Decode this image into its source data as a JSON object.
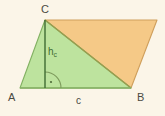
{
  "figure": {
    "kind": "geometry-diagram",
    "background_color": "#fbf5e8",
    "vertices": {
      "A": {
        "label": "A",
        "x": 20,
        "y": 88
      },
      "B": {
        "label": "B",
        "x": 131,
        "y": 88
      },
      "C": {
        "label": "C",
        "x": 45,
        "y": 20
      },
      "D": {
        "label": "D",
        "x": 157,
        "y": 20
      }
    },
    "shapes": {
      "green_triangle": {
        "name": "triangle-ABC",
        "points": "20,88 131,88 45,20",
        "fill": "#bde39e",
        "stroke": "#7fae5e"
      },
      "orange_triangle": {
        "name": "triangle-CBD",
        "points": "45,20 157,20 131,88",
        "fill": "#f5c987",
        "stroke": "#d2a45e"
      }
    },
    "altitude": {
      "name": "height-hc",
      "label": "h",
      "subscript": "c",
      "from_x": 45,
      "from_y": 20,
      "to_x": 45,
      "to_y": 88,
      "color": "#3f6b33"
    },
    "base": {
      "name": "base-c",
      "label": "c",
      "from_x": 20,
      "from_y": 88,
      "to_x": 131,
      "to_y": 88,
      "color": "#4a4a42"
    },
    "right_angle": {
      "name": "right-angle-marker",
      "center_x": 45,
      "center_y": 88,
      "radius": 16,
      "color": "#6f8c52",
      "dot": "·"
    }
  }
}
